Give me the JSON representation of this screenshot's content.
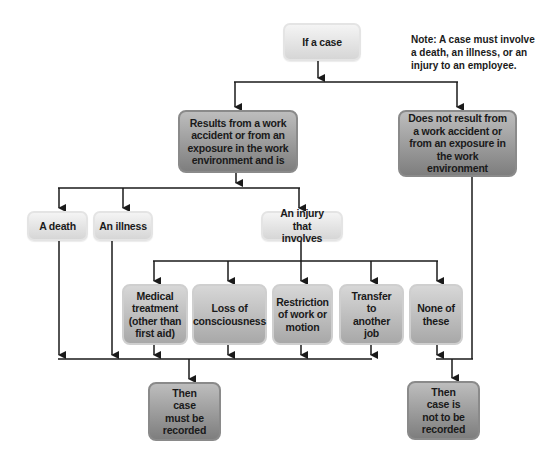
{
  "diagram": {
    "type": "flowchart",
    "note": "Note: A case must involve a death, an illness, or an injury to an employee.",
    "nodes": {
      "start": "If a case",
      "work_related": "Results from a work accident or from an exposure in the work environment and is",
      "not_work_related": "Does not result from a work accident or from an exposure in the work environment",
      "death": "A death",
      "illness": "An illness",
      "injury": "An injury that involves",
      "medical": "Medical treatment (other than first aid)",
      "loss": "Loss of consciousness",
      "restriction": "Restriction of work or motion",
      "transfer": "Transfer to another job",
      "none": "None of these",
      "recorded": "Then case must be recorded",
      "not_recorded": "Then case is not to be recorded"
    },
    "edges": [
      [
        "start",
        "work_related"
      ],
      [
        "start",
        "not_work_related"
      ],
      [
        "work_related",
        "death"
      ],
      [
        "work_related",
        "illness"
      ],
      [
        "work_related",
        "injury"
      ],
      [
        "injury",
        "medical"
      ],
      [
        "injury",
        "loss"
      ],
      [
        "injury",
        "restriction"
      ],
      [
        "injury",
        "transfer"
      ],
      [
        "injury",
        "none"
      ],
      [
        "death",
        "recorded"
      ],
      [
        "illness",
        "recorded"
      ],
      [
        "medical",
        "recorded"
      ],
      [
        "loss",
        "recorded"
      ],
      [
        "restriction",
        "recorded"
      ],
      [
        "transfer",
        "recorded"
      ],
      [
        "none",
        "not_recorded"
      ],
      [
        "not_work_related",
        "not_recorded"
      ]
    ],
    "colors": {
      "light_box": "#e6e6e6",
      "mid_box": "#bdbdbd",
      "dark_box": "#9a9a9a",
      "line": "#1a1a1a"
    }
  }
}
